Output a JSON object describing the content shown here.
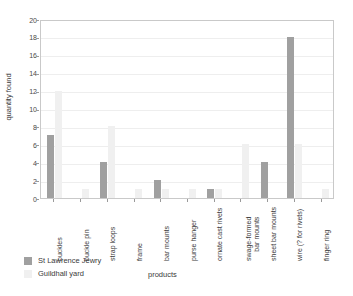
{
  "chart_data": {
    "type": "bar",
    "title": "",
    "xlabel": "products",
    "ylabel": "quantity found",
    "ylim": [
      0,
      20
    ],
    "ytick_step": 2,
    "yticks": [
      0,
      2,
      4,
      6,
      8,
      10,
      12,
      14,
      16,
      18,
      20
    ],
    "grid": true,
    "grid_axis": "y",
    "legend_position": "bottom-left",
    "categories": [
      "buckles",
      "buckle pin",
      "strap loops",
      "frame",
      "bar mounts",
      "purse hanger",
      "ornate cast rivets",
      "swage-formed bar mounts",
      "sheet bar mounts",
      "wire (? for rivets)",
      "finger ring"
    ],
    "category_lines": [
      [
        "buckles"
      ],
      [
        "buckle pin"
      ],
      [
        "strap loops"
      ],
      [
        "frame"
      ],
      [
        "bar mounts"
      ],
      [
        "purse hanger"
      ],
      [
        "ornate cast rivets"
      ],
      [
        "swage-formed",
        "bar mounts"
      ],
      [
        "sheet bar mounts"
      ],
      [
        "wire (? for rivets)"
      ],
      [
        "finger ring"
      ]
    ],
    "series": [
      {
        "name": "St Lawrence Jewry",
        "color": "#a0a0a0",
        "values": [
          7,
          0,
          4,
          0,
          2,
          0,
          1,
          0,
          4,
          18,
          0
        ]
      },
      {
        "name": "Guildhall yard",
        "color": "#f0f0f0",
        "values": [
          12,
          1,
          8,
          1,
          1,
          1,
          1,
          6,
          0,
          6,
          1
        ]
      }
    ]
  }
}
